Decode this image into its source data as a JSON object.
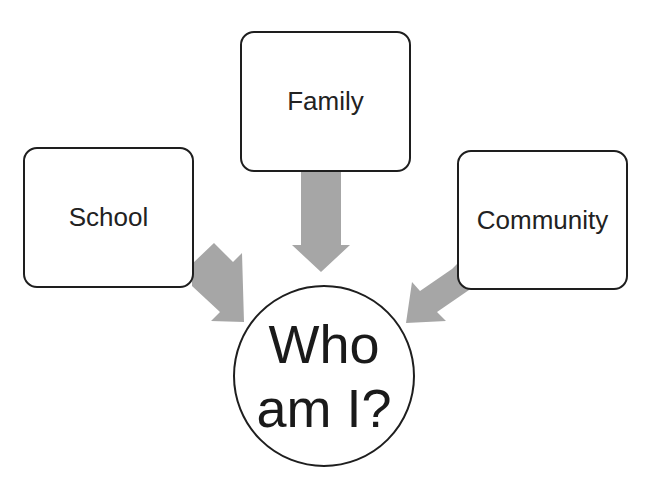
{
  "diagram": {
    "type": "influence-diagram",
    "nodes": [
      {
        "id": "family",
        "label": "Family",
        "shape": "rounded-rectangle"
      },
      {
        "id": "school",
        "label": "School",
        "shape": "rounded-rectangle"
      },
      {
        "id": "community",
        "label": "Community",
        "shape": "rounded-rectangle"
      },
      {
        "id": "center",
        "label_line1": "Who",
        "label_line2": "am I?",
        "shape": "circle"
      }
    ],
    "edges": [
      {
        "from": "family",
        "to": "center",
        "style": "block-arrow"
      },
      {
        "from": "school",
        "to": "center",
        "style": "block-arrow"
      },
      {
        "from": "community",
        "to": "center",
        "style": "block-arrow"
      }
    ],
    "colors": {
      "arrow": "#a6a6a6",
      "border": "#1e1e1e",
      "background": "#ffffff"
    }
  }
}
